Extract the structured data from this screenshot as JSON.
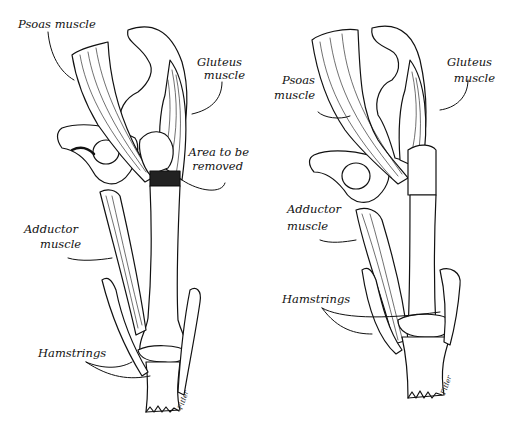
{
  "figure": {
    "type": "anatomical-illustration",
    "ink_color": "#111111",
    "background": "#ffffff",
    "panels": [
      {
        "id": "left",
        "description": "Hip joint with femur before procedure",
        "labels": {
          "psoas": "Psoas muscle",
          "gluteus_1": "Gluteus",
          "gluteus_2": "muscle",
          "area_1": "Area to be",
          "area_2": "removed",
          "adductor_1": "Adductor",
          "adductor_2": "muscle",
          "hamstrings": "Hamstrings"
        },
        "signature": "Fitler"
      },
      {
        "id": "right",
        "description": "Hip joint after femoral section removed",
        "labels": {
          "psoas_1": "Psoas",
          "psoas_2": "muscle",
          "gluteus_1": "Gluteus",
          "gluteus_2": "muscle",
          "adductor_1": "Adductor",
          "adductor_2": "muscle",
          "hamstrings": "Hamstrings"
        },
        "signature": "Fitler"
      }
    ]
  }
}
